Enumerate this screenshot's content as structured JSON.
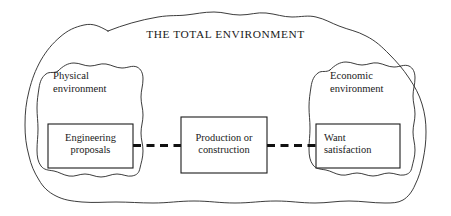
{
  "diagram": {
    "title": "THE TOTAL ENVIRONMENT",
    "regions": [
      {
        "id": "physical",
        "label": "Physical\nenvironment"
      },
      {
        "id": "economic",
        "label": "Economic\nenvironment"
      }
    ],
    "boxes": [
      {
        "id": "engineering-proposals",
        "label": "Engineering\nproposals"
      },
      {
        "id": "production-or-construction",
        "label": "Production or\nconstruction"
      },
      {
        "id": "want-satisfaction",
        "label": "Want\nsatisfaction"
      }
    ],
    "connectors": [
      {
        "id": "left-connector",
        "style": "dashed"
      },
      {
        "id": "right-connector",
        "style": "dashed"
      }
    ],
    "colors": {
      "background": "#ffffff",
      "outline": "#262626",
      "box_border": "#1c1c1c",
      "text": "#1a1a1a",
      "connector": "#111111"
    }
  }
}
